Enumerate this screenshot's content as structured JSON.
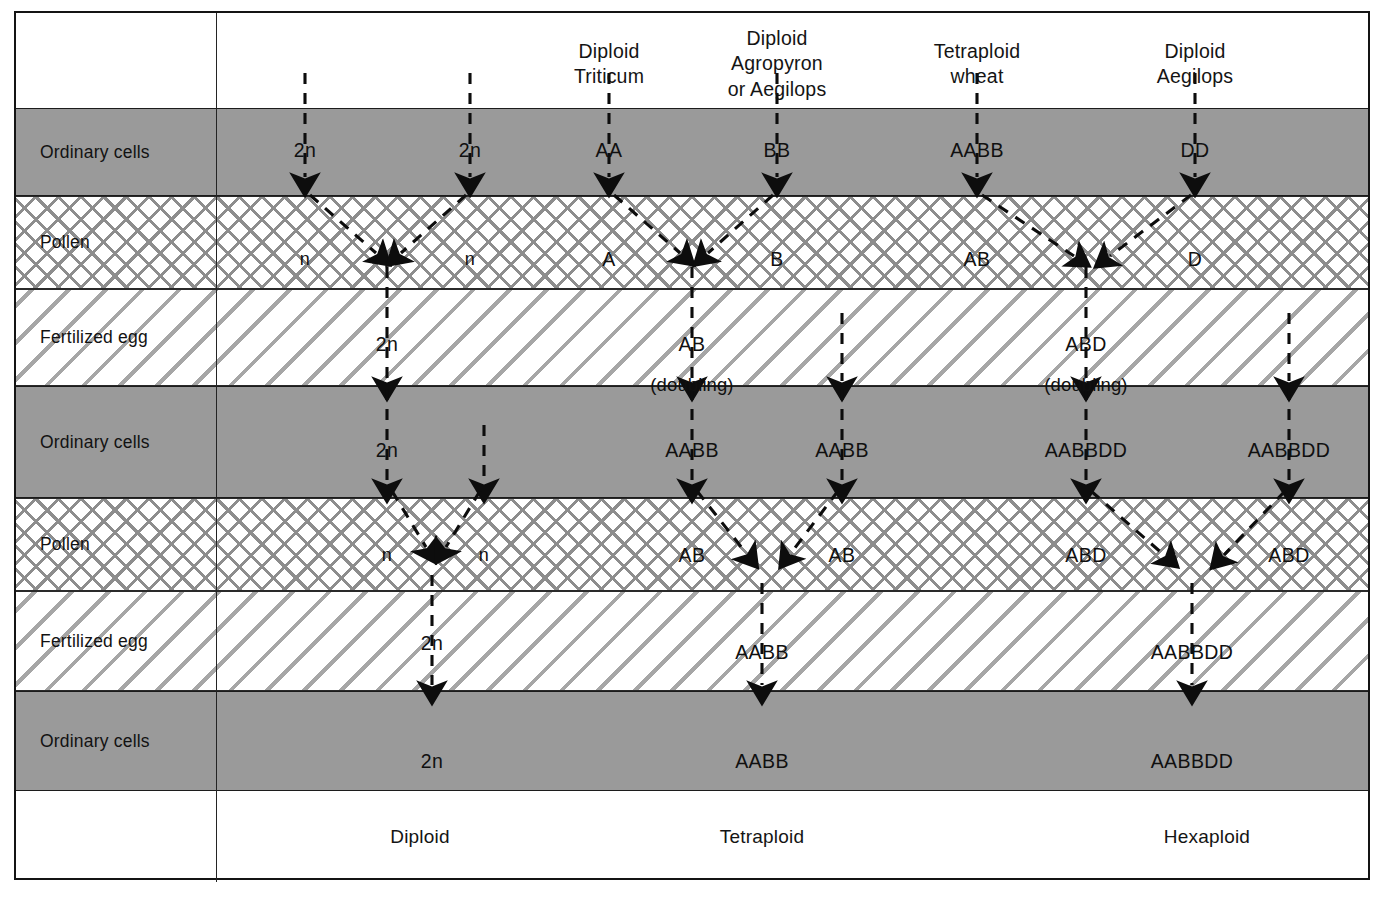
{
  "diagram": {
    "colors": {
      "band_gray": "#9a9a9a",
      "hatch_line": "#8d8d8d",
      "ink": "#101010",
      "frame": "#141414"
    },
    "column_headers": [
      {
        "id": "diploid-triticum",
        "lines": [
          "Diploid",
          "Triticum"
        ],
        "x": 607
      },
      {
        "id": "diploid-agropyron",
        "lines": [
          "Diploid",
          "Agropyron",
          "or Aegilops"
        ],
        "x": 775
      },
      {
        "id": "tetraploid-wheat",
        "lines": [
          "Tetraploid",
          "wheat"
        ],
        "x": 975
      },
      {
        "id": "diploid-aegilops",
        "lines": [
          "Diploid",
          "Aegilops"
        ],
        "x": 1193
      }
    ],
    "row_labels": [
      {
        "id": "ordinary-cells-1",
        "label": "Ordinary cells",
        "band": "gray"
      },
      {
        "id": "pollen-1",
        "label": "Pollen",
        "band": "cross"
      },
      {
        "id": "fertilized-egg-1",
        "label": "Fertilized egg",
        "band": "diag"
      },
      {
        "id": "ordinary-cells-2",
        "label": "Ordinary cells",
        "band": "gray"
      },
      {
        "id": "pollen-2",
        "label": "Pollen",
        "band": "cross"
      },
      {
        "id": "fertilized-egg-2",
        "label": "Fertilized egg",
        "band": "diag"
      },
      {
        "id": "ordinary-cells-3",
        "label": "Ordinary cells",
        "band": "gray"
      }
    ],
    "nodes": [
      {
        "id": "n-2n-a",
        "text": "2n",
        "x": 303,
        "y": 148
      },
      {
        "id": "n-2n-b",
        "text": "2n",
        "x": 468,
        "y": 148
      },
      {
        "id": "n-AA",
        "text": "AA",
        "x": 607,
        "y": 148
      },
      {
        "id": "n-BB",
        "text": "BB",
        "x": 775,
        "y": 148
      },
      {
        "id": "n-AABB-top",
        "text": "AABB",
        "x": 975,
        "y": 148
      },
      {
        "id": "n-DD",
        "text": "DD",
        "x": 1193,
        "y": 148
      },
      {
        "id": "n-n-a",
        "text": "n",
        "x": 303,
        "y": 257
      },
      {
        "id": "n-n-b",
        "text": "n",
        "x": 468,
        "y": 257
      },
      {
        "id": "n-A",
        "text": "A",
        "x": 607,
        "y": 257
      },
      {
        "id": "n-B",
        "text": "B",
        "x": 775,
        "y": 257
      },
      {
        "id": "n-AB-p1",
        "text": "AB",
        "x": 975,
        "y": 257
      },
      {
        "id": "n-D",
        "text": "D",
        "x": 1193,
        "y": 257
      },
      {
        "id": "n-2n-fert1",
        "text": "2n",
        "x": 385,
        "y": 342
      },
      {
        "id": "n-AB-fert1",
        "text": "AB",
        "x": 690,
        "y": 342
      },
      {
        "id": "n-ABD-fert1",
        "text": "ABD",
        "x": 1084,
        "y": 342
      },
      {
        "id": "n-doubling-1",
        "text": "(doubling)",
        "x": 690,
        "y": 383
      },
      {
        "id": "n-doubling-2",
        "text": "(doubling)",
        "x": 1084,
        "y": 383
      },
      {
        "id": "n-2n-ord2",
        "text": "2n",
        "x": 385,
        "y": 448
      },
      {
        "id": "n-AABB-ord2a",
        "text": "AABB",
        "x": 690,
        "y": 448
      },
      {
        "id": "n-AABB-ord2b",
        "text": "AABB",
        "x": 840,
        "y": 448
      },
      {
        "id": "n-AABBDD-ord2a",
        "text": "AABBDD",
        "x": 1084,
        "y": 448
      },
      {
        "id": "n-AABBDD-ord2b",
        "text": "AABBDD",
        "x": 1287,
        "y": 448
      },
      {
        "id": "n-n-c",
        "text": "n",
        "x": 385,
        "y": 553
      },
      {
        "id": "n-n-d",
        "text": "n",
        "x": 482,
        "y": 553
      },
      {
        "id": "n-AB-p2a",
        "text": "AB",
        "x": 690,
        "y": 553
      },
      {
        "id": "n-AB-p2b",
        "text": "AB",
        "x": 840,
        "y": 553
      },
      {
        "id": "n-ABD-p2a",
        "text": "ABD",
        "x": 1084,
        "y": 553
      },
      {
        "id": "n-ABD-p2b",
        "text": "ABD",
        "x": 1287,
        "y": 553
      },
      {
        "id": "n-2n-fert2",
        "text": "2n",
        "x": 430,
        "y": 641
      },
      {
        "id": "n-AABB-fert2",
        "text": "AABB",
        "x": 760,
        "y": 650
      },
      {
        "id": "n-AABBDD-fert2",
        "text": "AABBDD",
        "x": 1190,
        "y": 650
      },
      {
        "id": "n-2n-ord3",
        "text": "2n",
        "x": 430,
        "y": 759
      },
      {
        "id": "n-AABB-ord3",
        "text": "AABB",
        "x": 760,
        "y": 759
      },
      {
        "id": "n-AABBDD-ord3",
        "text": "AABBDD",
        "x": 1190,
        "y": 759
      }
    ],
    "footer": [
      {
        "id": "ploidy-diploid",
        "label": "Diploid",
        "x": 418
      },
      {
        "id": "ploidy-tetraploid",
        "label": "Tetraploid",
        "x": 760
      },
      {
        "id": "ploidy-hexaploid",
        "label": "Hexaploid",
        "x": 1205
      }
    ]
  }
}
